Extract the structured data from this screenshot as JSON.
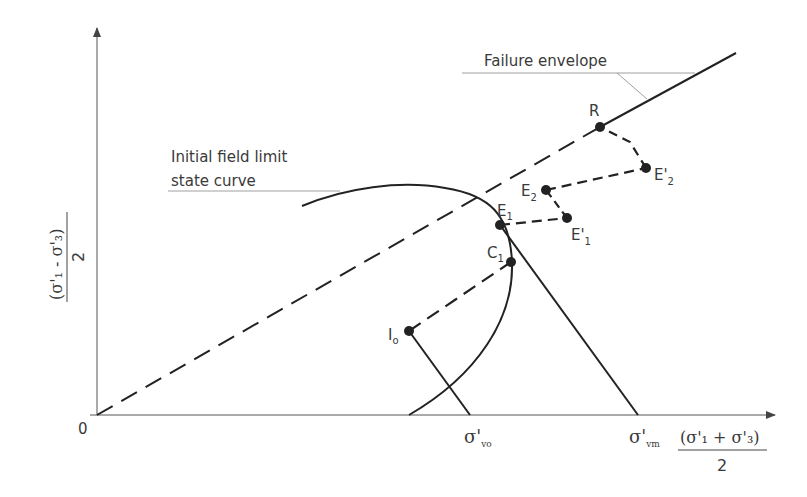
{
  "diagram": {
    "labels": {
      "origin": "0",
      "failure_envelope": "Failure envelope",
      "initial_curve_line1": "Initial field limit",
      "initial_curve_line2": "state curve",
      "sigma_vo_main": "σ'",
      "sigma_vo_sub": "vo",
      "sigma_vm_main": "σ'",
      "sigma_vm_sub": "vm",
      "x_axis_numerator": "(σ'₁ + σ'₃)",
      "x_axis_denominator": "2",
      "y_axis_numerator": "(σ'₁ - σ'₃)",
      "y_axis_denominator": "2"
    },
    "points": {
      "R": "R",
      "E2p": "E'",
      "E2p_sub": "2",
      "E2": "E",
      "E2_sub": "2",
      "E1": "E",
      "E1_sub": "1",
      "E1p": "E'",
      "E1p_sub": "1",
      "C1": "C",
      "C1_sub": "1",
      "Io": "I",
      "Io_sub": "o"
    }
  }
}
